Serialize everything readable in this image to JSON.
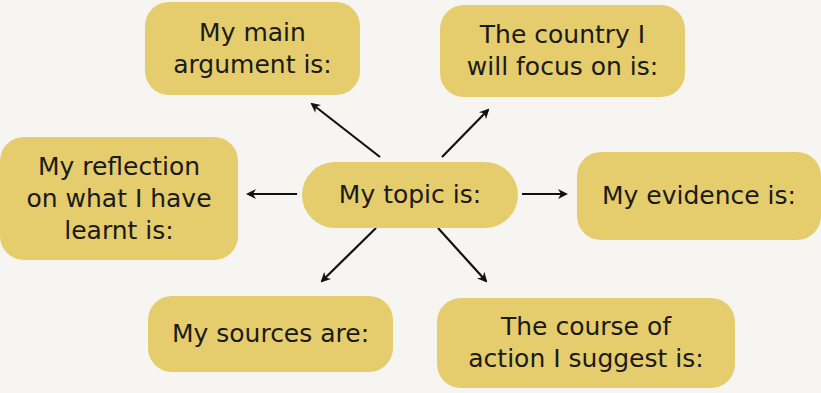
{
  "diagram": {
    "type": "mind-map",
    "fill_color": "#e5cc6d",
    "center": {
      "label": "My topic is:"
    },
    "nodes": [
      {
        "id": "main-argument",
        "label": "My main argument is:",
        "lines": [
          "My main",
          "argument is:"
        ]
      },
      {
        "id": "country",
        "label": "The country I will focus on is:",
        "lines": [
          "The country I",
          "will focus on is:"
        ]
      },
      {
        "id": "reflection",
        "label": "My reflection on what I have learnt is:",
        "lines": [
          "My reflection",
          "on what I have",
          "learnt is:"
        ]
      },
      {
        "id": "evidence",
        "label": "My evidence is:",
        "lines": [
          "My evidence is:"
        ]
      },
      {
        "id": "sources",
        "label": "My sources are:",
        "lines": [
          "My sources are:"
        ]
      },
      {
        "id": "course-of-action",
        "label": "The course of action I suggest is:",
        "lines": [
          "The course of",
          "action I suggest is:"
        ]
      }
    ],
    "edges": [
      {
        "from": "center",
        "to": "main-argument"
      },
      {
        "from": "center",
        "to": "country"
      },
      {
        "from": "center",
        "to": "reflection"
      },
      {
        "from": "center",
        "to": "evidence"
      },
      {
        "from": "center",
        "to": "sources"
      },
      {
        "from": "center",
        "to": "course-of-action"
      }
    ]
  }
}
